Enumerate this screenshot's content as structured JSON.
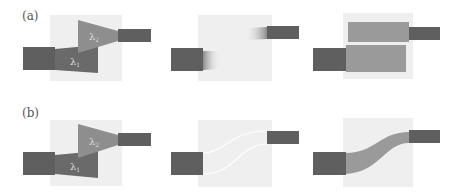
{
  "figure": {
    "rows": [
      {
        "id": "a",
        "label": "(a)",
        "panels": [
          {
            "id": "a1",
            "description": "wavelength demultiplexer: input waveguide splitting into two tapered regions",
            "lambda_top": "λ",
            "lambda_top_sub": "2",
            "lambda_bottom": "λ",
            "lambda_bottom_sub": "1"
          },
          {
            "id": "a2",
            "description": "input/output waveguides with gradient tapers, empty design region"
          },
          {
            "id": "a3",
            "description": "design region filled with two rectangular blocks"
          }
        ]
      },
      {
        "id": "b",
        "label": "(b)",
        "panels": [
          {
            "id": "b1",
            "description": "wavelength demultiplexer: input waveguide splitting into two tapered regions",
            "lambda_top": "λ",
            "lambda_top_sub": "2",
            "lambda_bottom": "λ",
            "lambda_bottom_sub": "1"
          },
          {
            "id": "b2",
            "description": "S-bend outline in design region connecting offset waveguides"
          },
          {
            "id": "b3",
            "description": "filled S-bend waveguide connecting offset waveguides"
          }
        ]
      }
    ],
    "colors": {
      "background": "#ffffff",
      "design_region": "#efefef",
      "waveguide_dark": "#5f5f5f",
      "region_mid": "#6e6e6e",
      "region_light": "#8c8c8c",
      "block_fill": "#9a9a9a",
      "label_text": "#555555"
    }
  }
}
